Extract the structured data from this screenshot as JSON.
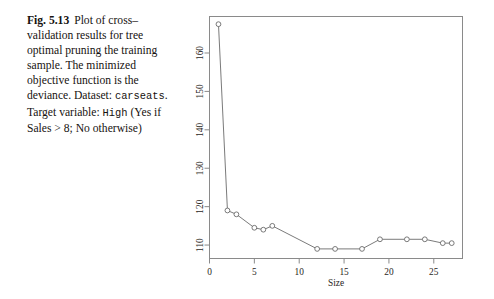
{
  "caption": {
    "fig_label": "Fig. 5.13",
    "line1": "Plot of",
    "line2": "cross–validation results for",
    "line3": "tree optimal pruning the",
    "line4": "training sample. The",
    "line5": "minimized objective function",
    "line6": "is the deviance. Dataset:",
    "dataset_name": "carseats",
    "line7_tail": ". Target variable:",
    "variable_name": "High",
    "line8_tail": "(Yes if Sales > 8; No",
    "line9": "otherwise)"
  },
  "chart_data": {
    "type": "line",
    "title": "",
    "xlabel": "Size",
    "ylabel": "",
    "xlim": [
      0,
      28.2
    ],
    "ylim": [
      106.5,
      169.5
    ],
    "xticks": [
      0,
      5,
      10,
      15,
      20,
      25
    ],
    "xticklabels": [
      "0",
      "5",
      "10",
      "15",
      "20",
      "25"
    ],
    "yticks": [
      110,
      120,
      130,
      140,
      150,
      160
    ],
    "yticklabels": [
      "110",
      "120",
      "130",
      "140",
      "150",
      "160"
    ],
    "grid": false,
    "legend": false,
    "marker": "open-circle",
    "line_color": "#6b6b6b",
    "marker_color": "#6b6b6b",
    "frame_color": "#8a8a8a",
    "x": [
      1,
      2,
      3,
      5,
      6,
      7,
      12,
      14,
      17,
      19,
      22,
      24,
      26,
      27
    ],
    "y": [
      167.5,
      119.0,
      118.0,
      114.5,
      114.0,
      115.0,
      109.0,
      109.0,
      109.0,
      111.5,
      111.5,
      111.5,
      110.5,
      110.5
    ]
  }
}
